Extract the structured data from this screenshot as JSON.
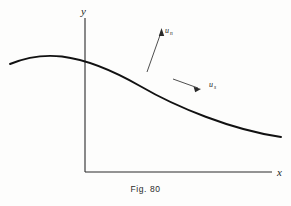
{
  "figure": {
    "caption": "Fig. 80",
    "axes": {
      "y_label": "y",
      "x_label": "x",
      "origin_x": 85,
      "origin_y": 172,
      "x_axis_end": 272,
      "y_axis_top": 18
    },
    "vectors": [
      {
        "id": "normal",
        "label_main": "u",
        "label_sub": "n",
        "description": "normal-velocity-vector"
      },
      {
        "id": "tangential",
        "label_main": "u",
        "label_sub": "s",
        "description": "tangential-velocity-vector"
      }
    ],
    "curve": {
      "description": "surface-profile-curve",
      "peak_x": 55,
      "peak_y": 56,
      "left_end_x": 10,
      "left_end_y": 64,
      "right_end_x": 281,
      "right_end_y": 137,
      "y_axis_crossing_y": 60
    },
    "colors": {
      "ink": "#1d1d1d",
      "paper": "#fdfdfc",
      "curve": "#111111"
    }
  }
}
